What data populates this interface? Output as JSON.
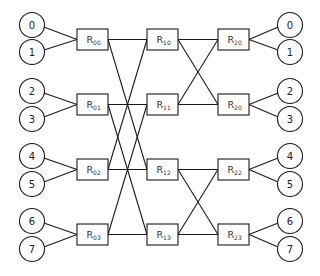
{
  "diagram": {
    "colors": {
      "stroke": "#1a1a1a",
      "background": "#ffffff",
      "text": "#222222"
    },
    "input_nodes": [
      {
        "label": "0",
        "cx": 32,
        "cy": 25
      },
      {
        "label": "1",
        "cx": 32,
        "cy": 52
      },
      {
        "label": "2",
        "cx": 32,
        "cy": 91
      },
      {
        "label": "3",
        "cx": 32,
        "cy": 119
      },
      {
        "label": "4",
        "cx": 32,
        "cy": 156
      },
      {
        "label": "5",
        "cx": 32,
        "cy": 184
      },
      {
        "label": "6",
        "cx": 32,
        "cy": 221
      },
      {
        "label": "7",
        "cx": 32,
        "cy": 249
      }
    ],
    "output_nodes": [
      {
        "label": "0",
        "cx": 290,
        "cy": 25
      },
      {
        "label": "1",
        "cx": 290,
        "cy": 52
      },
      {
        "label": "2",
        "cx": 290,
        "cy": 91
      },
      {
        "label": "3",
        "cx": 290,
        "cy": 119
      },
      {
        "label": "4",
        "cx": 290,
        "cy": 156
      },
      {
        "label": "5",
        "cx": 290,
        "cy": 184
      },
      {
        "label": "6",
        "cx": 290,
        "cy": 221
      },
      {
        "label": "7",
        "cx": 290,
        "cy": 249
      }
    ],
    "routers": [
      {
        "id": "R00",
        "base": "R",
        "sub": "00",
        "x": 77,
        "y": 29
      },
      {
        "id": "R01",
        "base": "R",
        "sub": "01",
        "x": 77,
        "y": 94
      },
      {
        "id": "R02",
        "base": "R",
        "sub": "02",
        "x": 77,
        "y": 159
      },
      {
        "id": "R03",
        "base": "R",
        "sub": "03",
        "x": 77,
        "y": 224
      },
      {
        "id": "R10",
        "base": "R",
        "sub": "10",
        "x": 147,
        "y": 29
      },
      {
        "id": "R11",
        "base": "R",
        "sub": "11",
        "x": 147,
        "y": 94
      },
      {
        "id": "R12",
        "base": "R",
        "sub": "12",
        "x": 147,
        "y": 159
      },
      {
        "id": "R13",
        "base": "R",
        "sub": "13",
        "x": 147,
        "y": 224
      },
      {
        "id": "R20a",
        "base": "R",
        "sub": "20",
        "x": 218,
        "y": 29
      },
      {
        "id": "R20b",
        "base": "R",
        "sub": "20",
        "x": 218,
        "y": 94
      },
      {
        "id": "R22",
        "base": "R",
        "sub": "22",
        "x": 218,
        "y": 159
      },
      {
        "id": "R23",
        "base": "R",
        "sub": "23",
        "x": 218,
        "y": 224
      }
    ],
    "router_size": {
      "w": 31,
      "h": 21
    },
    "node_radius": 12.5,
    "links_stage0_to_1": [
      [
        "R00",
        "R10"
      ],
      [
        "R00",
        "R12"
      ],
      [
        "R01",
        "R11"
      ],
      [
        "R01",
        "R13"
      ],
      [
        "R02",
        "R12"
      ],
      [
        "R02",
        "R10"
      ],
      [
        "R03",
        "R13"
      ],
      [
        "R03",
        "R11"
      ]
    ],
    "links_stage1_to_2": [
      [
        "R10",
        "R20a"
      ],
      [
        "R10",
        "R20b"
      ],
      [
        "R11",
        "R20b"
      ],
      [
        "R11",
        "R20a"
      ],
      [
        "R12",
        "R22"
      ],
      [
        "R12",
        "R23"
      ],
      [
        "R13",
        "R23"
      ],
      [
        "R13",
        "R22"
      ]
    ]
  }
}
